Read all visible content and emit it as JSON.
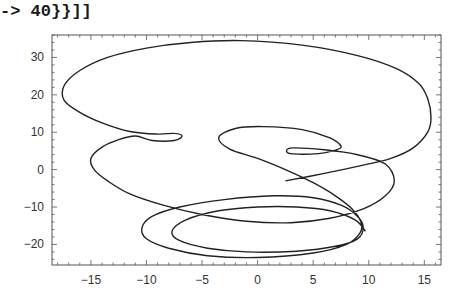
{
  "code_fragment": "-> 40}}]]",
  "chart_data": {
    "type": "line",
    "subtype": "parametric",
    "title": "",
    "xlabel": "",
    "ylabel": "",
    "xlim": [
      -18.5,
      16.5
    ],
    "ylim": [
      -25.5,
      36
    ],
    "grid": false,
    "legend": "none",
    "x_ticks": [
      -15,
      -10,
      -5,
      0,
      5,
      10,
      15
    ],
    "x_tick_labels": [
      "−15",
      "−10",
      "−5",
      "0",
      "5",
      "10",
      "15"
    ],
    "y_ticks": [
      -20,
      -10,
      0,
      10,
      20,
      30
    ],
    "y_tick_labels": [
      "−20",
      "−10",
      "0",
      "10",
      "20",
      "30"
    ],
    "series": [
      {
        "name": "curve",
        "color": "#222222",
        "points": [
          [
            2.5,
            -3
          ],
          [
            6,
            -1
          ],
          [
            9.5,
            1.2
          ],
          [
            12,
            3
          ],
          [
            14,
            5.8
          ],
          [
            15.3,
            10
          ],
          [
            15.6,
            14
          ],
          [
            15.3,
            19
          ],
          [
            14.5,
            23
          ],
          [
            12.5,
            27
          ],
          [
            9,
            30.5
          ],
          [
            4,
            33.3
          ],
          [
            -1.5,
            34.5
          ],
          [
            -6,
            34
          ],
          [
            -10,
            32.5
          ],
          [
            -13.5,
            30
          ],
          [
            -16,
            26.5
          ],
          [
            -17.4,
            22.5
          ],
          [
            -17.4,
            18.5
          ],
          [
            -16,
            15.3
          ],
          [
            -14,
            12.5
          ],
          [
            -11.5,
            10.2
          ],
          [
            -9,
            9.5
          ],
          [
            -7.5,
            9.7
          ],
          [
            -6.8,
            9
          ],
          [
            -7.5,
            7.8
          ],
          [
            -9.5,
            7.8
          ],
          [
            -11,
            9
          ],
          [
            -12.5,
            8
          ],
          [
            -14,
            6
          ],
          [
            -15,
            3
          ],
          [
            -14.7,
            0
          ],
          [
            -13.5,
            -3
          ],
          [
            -11.5,
            -6.5
          ],
          [
            -8.5,
            -9.5
          ],
          [
            -5,
            -12
          ],
          [
            -1,
            -13.8
          ],
          [
            3,
            -14.2
          ],
          [
            6.5,
            -13
          ],
          [
            9.5,
            -10.5
          ],
          [
            11.5,
            -7
          ],
          [
            12.3,
            -3
          ],
          [
            11.5,
            1.5
          ],
          [
            9,
            4
          ],
          [
            6,
            5.3
          ],
          [
            3.2,
            5.8
          ],
          [
            2.6,
            5
          ],
          [
            3.2,
            4.2
          ],
          [
            5.5,
            4.3
          ],
          [
            7,
            5.2
          ],
          [
            7.5,
            6.3
          ],
          [
            6.5,
            8.5
          ],
          [
            4,
            10.7
          ],
          [
            0.5,
            11.5
          ],
          [
            -2,
            11
          ],
          [
            -3.5,
            8.6
          ],
          [
            -2.5,
            5.5
          ],
          [
            0,
            3
          ],
          [
            2.5,
            0
          ],
          [
            5,
            -3.5
          ],
          [
            7,
            -7
          ],
          [
            8.5,
            -10.5
          ],
          [
            9.3,
            -14
          ],
          [
            9.2,
            -17
          ],
          [
            8,
            -20
          ],
          [
            5,
            -22.3
          ],
          [
            0,
            -23.5
          ],
          [
            -4.5,
            -23
          ],
          [
            -8,
            -21
          ],
          [
            -10,
            -18.5
          ],
          [
            -10.4,
            -15.5
          ],
          [
            -9.5,
            -12.5
          ],
          [
            -7,
            -10
          ],
          [
            -3,
            -8
          ],
          [
            1.5,
            -7
          ],
          [
            5,
            -7.5
          ],
          [
            7.5,
            -9.5
          ],
          [
            9,
            -12.5
          ],
          [
            9.5,
            -15.5
          ],
          [
            9,
            -18.5
          ],
          [
            7,
            -20.5
          ],
          [
            3.5,
            -21.8
          ],
          [
            -1,
            -22
          ],
          [
            -4.5,
            -21
          ],
          [
            -7,
            -19
          ],
          [
            -7.7,
            -16.5
          ],
          [
            -6.5,
            -13.5
          ],
          [
            -3.5,
            -11
          ],
          [
            0,
            -10
          ],
          [
            3.5,
            -10
          ],
          [
            6.5,
            -11
          ],
          [
            8.8,
            -13.5
          ],
          [
            9.7,
            -16.5
          ]
        ]
      }
    ]
  }
}
